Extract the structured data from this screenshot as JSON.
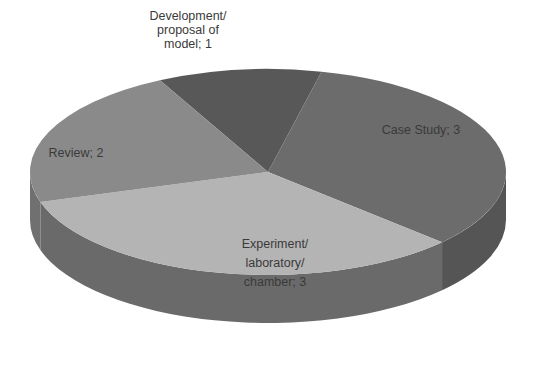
{
  "chart_data": {
    "type": "pie",
    "style": "3d",
    "title": "",
    "categories": [
      "Development/proposal of model",
      "Case Study",
      "Experiment/laboratory/chamber",
      "Review"
    ],
    "values": [
      1,
      3,
      3,
      2
    ],
    "colors": [
      "#585858",
      "#6c6c6c",
      "#b4b4b4",
      "#8a8a8a"
    ],
    "side_colors": [
      "#474747",
      "#555555",
      "#6a6a6a",
      "#707070"
    ],
    "legend": "none",
    "data_labels": [
      {
        "lines": [
          "Development/",
          "proposal of",
          "model; 1"
        ]
      },
      {
        "lines": [
          "Case Study; 3"
        ]
      },
      {
        "lines": [
          "Experiment/",
          "laboratory/",
          "chamber; 3"
        ]
      },
      {
        "lines": [
          "Review; 2"
        ]
      }
    ]
  }
}
